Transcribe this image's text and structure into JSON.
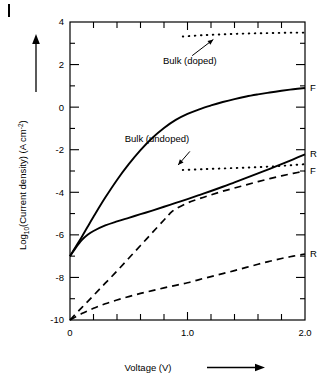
{
  "figure": {
    "corner_mark": "|",
    "background_color": "#ffffff",
    "ink_color": "#000000"
  },
  "chart_data": {
    "type": "line",
    "title": "",
    "subtitle": "",
    "xlabel": "Voltage (V)",
    "ylabel_parts": {
      "prefix": "Log",
      "subscript": "10",
      "middle": "(Current density) (A cm",
      "superscript": "-2",
      "suffix": ")"
    },
    "ylabel": "Log10(Current density) (A cm-2)",
    "xlim": [
      0,
      2.0
    ],
    "ylim": [
      -10,
      4
    ],
    "grid": false,
    "legend_position": "right-edge-labels",
    "x_ticks_major": [
      "0",
      "1.0",
      "2.0"
    ],
    "x_tick_major_values": [
      0,
      1.0,
      2.0
    ],
    "x_tick_minor_step": 0.2,
    "y_ticks_major": [
      "4",
      "2",
      "0",
      "-2",
      "-4",
      "-6",
      "-8",
      "-10"
    ],
    "y_tick_major_values": [
      4,
      2,
      0,
      -2,
      -4,
      -6,
      -8,
      -10
    ],
    "y_tick_minor_step": 1,
    "series": [
      {
        "name": "F",
        "style": "solid",
        "edge_label": "F",
        "edge_label_y": 0.9,
        "points": [
          [
            0.0,
            -7.0
          ],
          [
            0.05,
            -6.55
          ],
          [
            0.1,
            -6.1
          ],
          [
            0.15,
            -5.62
          ],
          [
            0.2,
            -5.15
          ],
          [
            0.3,
            -4.25
          ],
          [
            0.4,
            -3.42
          ],
          [
            0.5,
            -2.68
          ],
          [
            0.6,
            -2.02
          ],
          [
            0.7,
            -1.45
          ],
          [
            0.8,
            -0.98
          ],
          [
            0.9,
            -0.6
          ],
          [
            1.0,
            -0.32
          ],
          [
            1.1,
            -0.1
          ],
          [
            1.2,
            0.08
          ],
          [
            1.3,
            0.24
          ],
          [
            1.4,
            0.38
          ],
          [
            1.5,
            0.5
          ],
          [
            1.6,
            0.6
          ],
          [
            1.7,
            0.69
          ],
          [
            1.8,
            0.77
          ],
          [
            1.9,
            0.84
          ],
          [
            2.0,
            0.9
          ]
        ]
      },
      {
        "name": "R",
        "style": "solid",
        "edge_label": "R",
        "edge_label_y": -2.2,
        "points": [
          [
            0.0,
            -7.0
          ],
          [
            0.05,
            -6.6
          ],
          [
            0.1,
            -6.25
          ],
          [
            0.15,
            -6.0
          ],
          [
            0.2,
            -5.82
          ],
          [
            0.3,
            -5.56
          ],
          [
            0.4,
            -5.37
          ],
          [
            0.5,
            -5.2
          ],
          [
            0.6,
            -5.03
          ],
          [
            0.7,
            -4.86
          ],
          [
            0.8,
            -4.68
          ],
          [
            0.9,
            -4.5
          ],
          [
            1.0,
            -4.32
          ],
          [
            1.1,
            -4.13
          ],
          [
            1.2,
            -3.94
          ],
          [
            1.3,
            -3.74
          ],
          [
            1.4,
            -3.53
          ],
          [
            1.5,
            -3.32
          ],
          [
            1.6,
            -3.11
          ],
          [
            1.7,
            -2.9
          ],
          [
            1.8,
            -2.68
          ],
          [
            1.9,
            -2.45
          ],
          [
            2.0,
            -2.22
          ]
        ]
      },
      {
        "name": "F-dashed",
        "style": "dashed",
        "edge_label": "F",
        "edge_label_y": -3.0,
        "points": [
          [
            0.0,
            -10.0
          ],
          [
            0.1,
            -9.42
          ],
          [
            0.2,
            -8.85
          ],
          [
            0.3,
            -8.27
          ],
          [
            0.4,
            -7.7
          ],
          [
            0.5,
            -7.1
          ],
          [
            0.6,
            -6.5
          ],
          [
            0.7,
            -5.9
          ],
          [
            0.8,
            -5.3
          ],
          [
            0.85,
            -5.0
          ],
          [
            0.9,
            -4.78
          ],
          [
            1.0,
            -4.5
          ],
          [
            1.1,
            -4.3
          ],
          [
            1.2,
            -4.12
          ],
          [
            1.3,
            -3.95
          ],
          [
            1.4,
            -3.8
          ],
          [
            1.5,
            -3.65
          ],
          [
            1.6,
            -3.5
          ],
          [
            1.7,
            -3.36
          ],
          [
            1.8,
            -3.23
          ],
          [
            1.9,
            -3.11
          ],
          [
            2.0,
            -3.0
          ]
        ]
      },
      {
        "name": "R-dashed",
        "style": "dashed",
        "edge_label": "R",
        "edge_label_y": -6.9,
        "points": [
          [
            0.0,
            -10.0
          ],
          [
            0.1,
            -9.7
          ],
          [
            0.2,
            -9.45
          ],
          [
            0.3,
            -9.24
          ],
          [
            0.4,
            -9.06
          ],
          [
            0.5,
            -8.9
          ],
          [
            0.6,
            -8.75
          ],
          [
            0.7,
            -8.62
          ],
          [
            0.8,
            -8.49
          ],
          [
            0.9,
            -8.37
          ],
          [
            1.0,
            -8.25
          ],
          [
            1.1,
            -8.1
          ],
          [
            1.2,
            -7.96
          ],
          [
            1.3,
            -7.82
          ],
          [
            1.4,
            -7.68
          ],
          [
            1.5,
            -7.53
          ],
          [
            1.6,
            -7.38
          ],
          [
            1.7,
            -7.24
          ],
          [
            1.8,
            -7.11
          ],
          [
            1.9,
            -7.0
          ],
          [
            2.0,
            -6.9
          ]
        ]
      },
      {
        "name": "Bulk (doped)",
        "style": "dotted",
        "edge_label": "",
        "points": [
          [
            0.96,
            3.32
          ],
          [
            1.1,
            3.37
          ],
          [
            1.2,
            3.4
          ],
          [
            1.3,
            3.42
          ],
          [
            1.4,
            3.44
          ],
          [
            1.5,
            3.46
          ],
          [
            1.6,
            3.47
          ],
          [
            1.7,
            3.48
          ],
          [
            1.8,
            3.49
          ],
          [
            1.9,
            3.5
          ],
          [
            2.0,
            3.5
          ]
        ]
      },
      {
        "name": "Bulk (undoped)",
        "style": "dotted",
        "edge_label": "",
        "points": [
          [
            0.96,
            -2.95
          ],
          [
            1.1,
            -2.92
          ],
          [
            1.2,
            -2.9
          ],
          [
            1.3,
            -2.88
          ],
          [
            1.4,
            -2.86
          ],
          [
            1.5,
            -2.84
          ],
          [
            1.6,
            -2.82
          ],
          [
            1.7,
            -2.79
          ],
          [
            1.8,
            -2.76
          ],
          [
            1.9,
            -2.72
          ],
          [
            2.0,
            -2.68
          ]
        ]
      }
    ],
    "annotations": [
      {
        "id": "bulk-doped",
        "text": "Bulk (doped)",
        "text_x": 1.02,
        "text_y": 2.05,
        "arrow_from_x": 1.04,
        "arrow_from_y": 2.42,
        "arrow_to_x": 1.22,
        "arrow_to_y": 3.18
      },
      {
        "id": "bulk-undoped",
        "text": "Bulk (undoped)",
        "text_x": 0.74,
        "text_y": -1.62,
        "arrow_from_x": 1.02,
        "arrow_from_y": -2.08,
        "arrow_to_x": 0.92,
        "arrow_to_y": -2.72
      }
    ]
  }
}
